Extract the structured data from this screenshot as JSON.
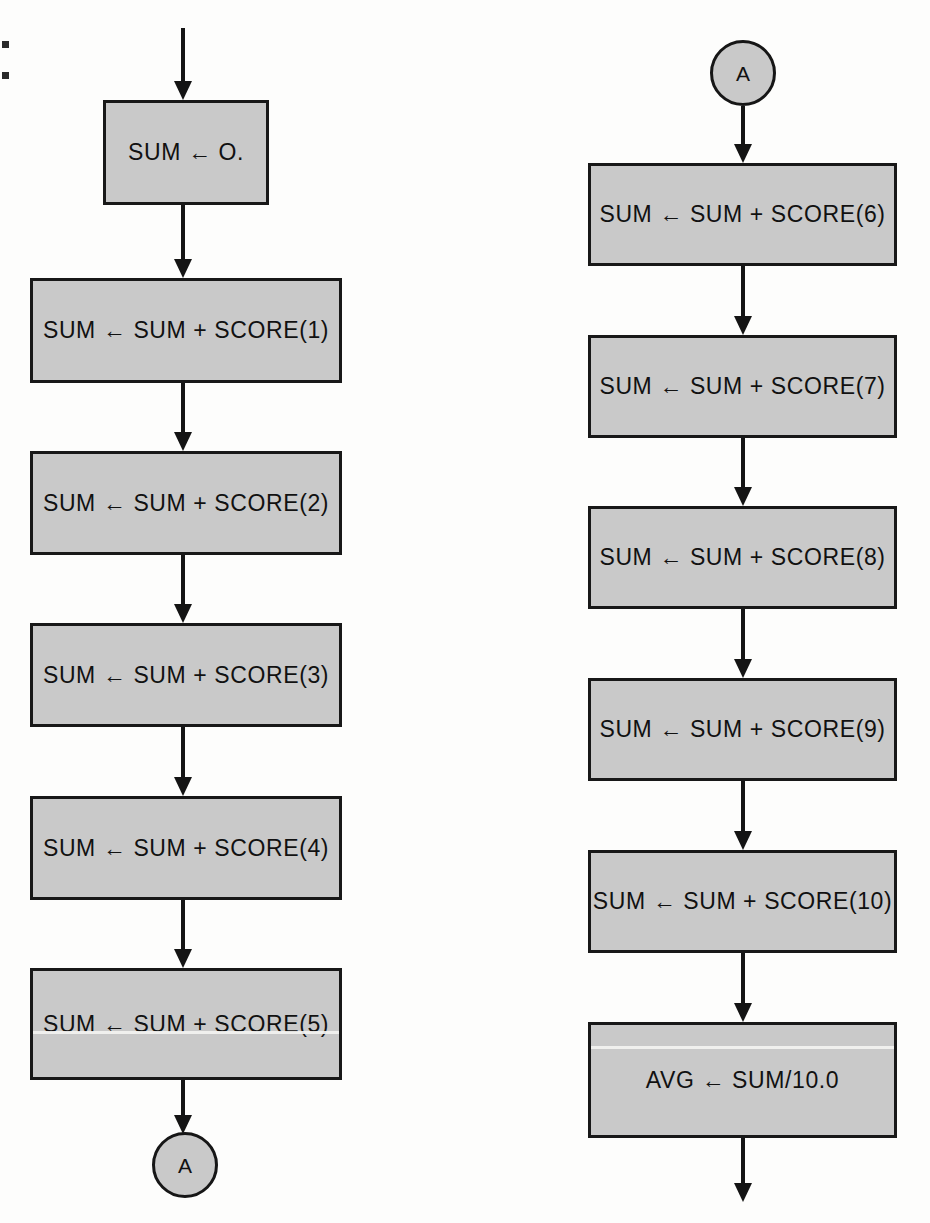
{
  "diagram": {
    "colors": {
      "node_fill": "#c9c9c9",
      "node_stroke": "#181818",
      "page_background": "#fdfdfc",
      "text": "#111111"
    },
    "columns": [
      {
        "name": "left-column",
        "entry_arrow": true,
        "nodes": [
          {
            "id": "init",
            "shape": "process",
            "text": "SUM ← O."
          },
          {
            "id": "score1",
            "shape": "process",
            "text": "SUM ← SUM + SCORE(1)"
          },
          {
            "id": "score2",
            "shape": "process",
            "text": "SUM ← SUM + SCORE(2)"
          },
          {
            "id": "score3",
            "shape": "process",
            "text": "SUM ← SUM + SCORE(3)"
          },
          {
            "id": "score4",
            "shape": "process",
            "text": "SUM ← SUM + SCORE(4)"
          },
          {
            "id": "score5",
            "shape": "process",
            "text": "SUM ← SUM + SCORE(5)"
          },
          {
            "id": "conn-a-out",
            "shape": "connector",
            "text": "A"
          }
        ]
      },
      {
        "name": "right-column",
        "entry_arrow": false,
        "nodes": [
          {
            "id": "conn-a-in",
            "shape": "connector",
            "text": "A"
          },
          {
            "id": "score6",
            "shape": "process",
            "text": "SUM ← SUM + SCORE(6)"
          },
          {
            "id": "score7",
            "shape": "process",
            "text": "SUM ← SUM + SCORE(7)"
          },
          {
            "id": "score8",
            "shape": "process",
            "text": "SUM ← SUM + SCORE(8)"
          },
          {
            "id": "score9",
            "shape": "process",
            "text": "SUM ← SUM + SCORE(9)"
          },
          {
            "id": "score10",
            "shape": "process",
            "text": "SUM ← SUM + SCORE(10)"
          },
          {
            "id": "avg",
            "shape": "process",
            "text": "AVG ← SUM/10.0"
          }
        ]
      }
    ]
  },
  "nodes": {
    "init": "SUM ← O.",
    "score1": "SUM ← SUM + SCORE(1)",
    "score2": "SUM ← SUM + SCORE(2)",
    "score3": "SUM ← SUM + SCORE(3)",
    "score4": "SUM ← SUM + SCORE(4)",
    "score5": "SUM ← SUM + SCORE(5)",
    "score6": "SUM ← SUM + SCORE(6)",
    "score7": "SUM ← SUM + SCORE(7)",
    "score8": "SUM ← SUM + SCORE(8)",
    "score9": "SUM ← SUM + SCORE(9)",
    "score10": "SUM ← SUM + SCORE(10)",
    "avg": "AVG ← SUM/10.0",
    "connector_out": "A",
    "connector_in": "A"
  }
}
